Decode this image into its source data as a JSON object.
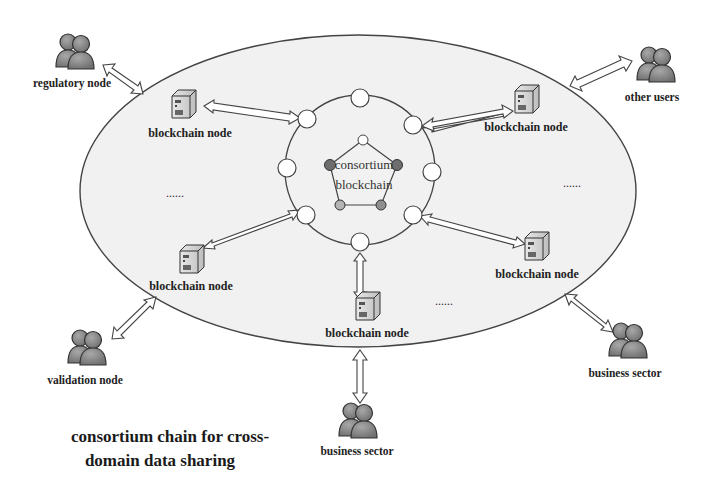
{
  "title": {
    "line1": "consortium chain for cross-",
    "line2": "domain data sharing"
  },
  "center": {
    "line1": "consortium",
    "line2": "blockchain"
  },
  "ellipsis": "......",
  "blockchain_nodes": [
    {
      "label": "blockchain node",
      "position": "top-left"
    },
    {
      "label": "blockchain node",
      "position": "top-right"
    },
    {
      "label": "blockchain node",
      "position": "bottom-left"
    },
    {
      "label": "blockchain node",
      "position": "bottom-center"
    },
    {
      "label": "blockchain node",
      "position": "bottom-right"
    }
  ],
  "external_entities": [
    {
      "label": "regulatory node",
      "icon": "people-icon"
    },
    {
      "label": "other users",
      "icon": "people-icon"
    },
    {
      "label": "validation node",
      "icon": "people-icon"
    },
    {
      "label": "business sector",
      "icon": "people-icon"
    },
    {
      "label": "business sector",
      "icon": "people-icon"
    }
  ],
  "colors": {
    "ellipse_fill": "#f1f1f1",
    "stroke": "#444444",
    "consensus_dark": "#6e6e6e",
    "consensus_light": "#b5b5b5",
    "people": "#8a8a8a"
  }
}
